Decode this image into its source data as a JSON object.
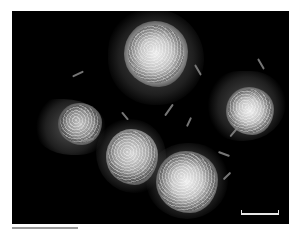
{
  "figure": {
    "type": "microscopy-image",
    "background": "#000000",
    "foreground": "#e8e8e8",
    "cells": [
      {
        "id": "cell-top-center",
        "cx": 150,
        "cy": 52,
        "r": 32
      },
      {
        "id": "cell-left",
        "cx": 66,
        "cy": 125,
        "r": 24
      },
      {
        "id": "cell-right",
        "cx": 239,
        "cy": 100,
        "r": 24
      },
      {
        "id": "cell-center",
        "cx": 119,
        "cy": 146,
        "r": 27
      },
      {
        "id": "cell-bottom-center",
        "cx": 178,
        "cy": 172,
        "r": 30
      }
    ],
    "scale_bar": {
      "label": ""
    }
  },
  "caption": {
    "text": " "
  }
}
